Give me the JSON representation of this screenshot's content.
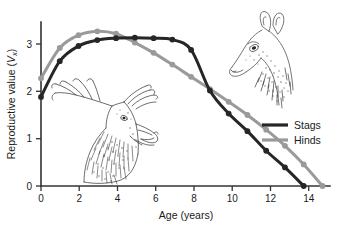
{
  "chart_data": {
    "type": "line",
    "title": "",
    "xlabel": "Age (years)",
    "ylabel": "Reproductive value (Vx)",
    "ylabel_plain": "Reproductive value",
    "ylabel_symbol": "V",
    "ylabel_subscript": "x",
    "xlim": [
      0,
      15.4
    ],
    "ylim": [
      0,
      3.35
    ],
    "xticks": [
      0,
      2,
      4,
      6,
      8,
      10,
      12,
      14
    ],
    "xticklabels": [
      "0",
      "2",
      "4",
      "6",
      "8",
      "10",
      "12",
      "14"
    ],
    "yticks": [
      0,
      1,
      2,
      3
    ],
    "yticklabels": [
      "0",
      "1",
      "2",
      "3"
    ],
    "grid": false,
    "legend_position": "right",
    "markers": "circle",
    "x": [
      0,
      1,
      2,
      3,
      4,
      5,
      6,
      7,
      8,
      9,
      10,
      11,
      12,
      13,
      14,
      15
    ],
    "series": [
      {
        "name": "Stags",
        "color": "#262626",
        "values": [
          1.82,
          2.55,
          2.86,
          2.98,
          3.02,
          3.03,
          3.02,
          2.99,
          2.78,
          1.95,
          1.48,
          1.12,
          0.72,
          0.38,
          0.0
        ],
        "x": [
          0,
          1,
          2,
          3,
          4,
          5,
          6,
          7,
          8,
          9,
          10,
          11,
          12,
          13,
          14
        ]
      },
      {
        "name": "Hinds",
        "color": "#9a9a9a",
        "values": [
          2.2,
          2.82,
          3.08,
          3.16,
          3.11,
          2.93,
          2.72,
          2.48,
          2.23,
          1.98,
          1.72,
          1.45,
          1.15,
          0.82,
          0.44,
          0.0
        ],
        "x": [
          0,
          1,
          2,
          3,
          4,
          5,
          6,
          7,
          8,
          9,
          10,
          11,
          12,
          13,
          14,
          15
        ]
      }
    ],
    "legend": [
      {
        "label": "Stags",
        "color": "#262626"
      },
      {
        "label": "Hinds",
        "color": "#9a9a9a"
      }
    ],
    "annotations": [
      {
        "name": "stag-illustration",
        "description": "Roaring red deer stag head with antlers"
      },
      {
        "name": "hind-illustration",
        "description": "Red deer hind head"
      }
    ]
  }
}
